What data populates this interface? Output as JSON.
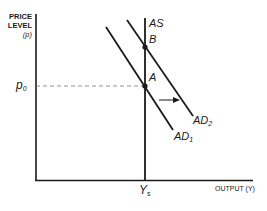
{
  "diagram": {
    "type": "economics-ad-as",
    "y_axis": {
      "line1": "PRICE",
      "line2": "LEVEL",
      "line3": "(p)"
    },
    "x_axis": {
      "label": "OUTPUT (Y)"
    },
    "curves": {
      "as": {
        "label": "AS"
      },
      "ad1": {
        "label": "AD",
        "sub": "1"
      },
      "ad2": {
        "label": "AD",
        "sub": "2"
      }
    },
    "points": {
      "a": {
        "label": "A"
      },
      "b": {
        "label": "B"
      }
    },
    "price_marker": {
      "label": "p",
      "sub": "0"
    },
    "output_marker": {
      "label": "Y",
      "sub": "s"
    },
    "shift_arrow": {
      "direction": "right"
    },
    "colors": {
      "line": "#1a1a1a",
      "dash": "#777777"
    }
  }
}
